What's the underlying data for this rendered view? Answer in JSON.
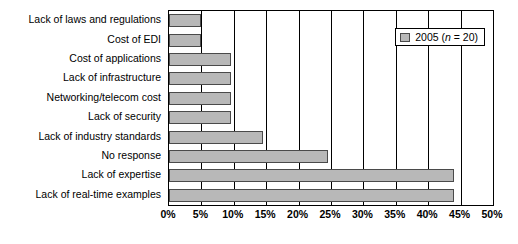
{
  "chart_data": {
    "type": "bar",
    "orientation": "horizontal",
    "title": "",
    "xlabel": "",
    "ylabel": "",
    "xlim": [
      0,
      50
    ],
    "xtick_labels": [
      "0%",
      "5%",
      "10%",
      "15%",
      "20%",
      "25%",
      "30%",
      "35%",
      "40%",
      "45%",
      "50%"
    ],
    "xtick_values": [
      0,
      5,
      10,
      15,
      20,
      25,
      30,
      35,
      40,
      45,
      50
    ],
    "grid": true,
    "categories": [
      "Lack of laws and regulations",
      "Cost of EDI",
      "Cost of applications",
      "Lack of infrastructure",
      "Networking/telecom cost",
      "Lack of security",
      "Lack of industry standards",
      "No response",
      "Lack of expertise",
      "Lack of real-time examples"
    ],
    "values": [
      5,
      5,
      9.5,
      9.5,
      9.5,
      9.5,
      14.5,
      24.5,
      44,
      44
    ],
    "series": [
      {
        "name": "2005 (n = 20)",
        "values": [
          5,
          5,
          9.5,
          9.5,
          9.5,
          9.5,
          14.5,
          24.5,
          44,
          44
        ],
        "color": "#b8b8b8"
      }
    ],
    "legend": {
      "position": "top-right",
      "entries": [
        {
          "label_main": "2005 (",
          "label_italic": "n",
          "label_tail": " = 20)",
          "swatch_color": "#b8b8b8"
        }
      ]
    }
  }
}
